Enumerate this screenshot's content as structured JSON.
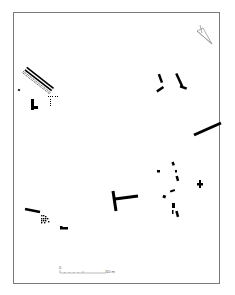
{
  "plan": {
    "type": "archaeological site plan",
    "background": "#ffffff",
    "feature_color": "#000000",
    "frame_color": "#7a7a7a"
  },
  "north_arrow": {
    "icon": "north-arrow-icon"
  },
  "scale_bar": {
    "start_label": "0",
    "end_label": "10 m",
    "divisions": 10
  }
}
